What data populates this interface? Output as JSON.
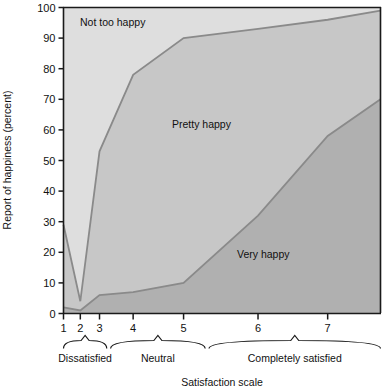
{
  "chart_data": {
    "type": "area",
    "title": "",
    "xlabel": "Satisfaction scale",
    "ylabel": "Report of happiness (percent)",
    "ylim": [
      0,
      100
    ],
    "xlim": [
      1,
      7.6
    ],
    "grid": false,
    "legend_position": "inline-labels",
    "y_ticks": [
      "0",
      "10",
      "20",
      "30",
      "40",
      "50",
      "60",
      "70",
      "80",
      "90",
      "100"
    ],
    "y_tick_values": [
      0,
      10,
      20,
      30,
      40,
      50,
      60,
      70,
      80,
      90,
      100
    ],
    "x_ticks": [
      "1",
      "2",
      "3",
      "4",
      "5",
      "6",
      "7"
    ],
    "x_tick_values": [
      1,
      2,
      3,
      4,
      5,
      6,
      7
    ],
    "x_tick_positions": [
      1.0,
      1.35,
      1.75,
      2.45,
      3.5,
      5.05,
      6.5
    ],
    "x": [
      1.0,
      1.35,
      1.75,
      2.45,
      3.5,
      5.05,
      6.5,
      7.6
    ],
    "series": [
      {
        "name": "Very happy",
        "label": "Very happy",
        "color": "#b0b0b0",
        "values": [
          2,
          1,
          6,
          7,
          10,
          32,
          58,
          70
        ]
      },
      {
        "name": "Pretty happy",
        "label": "Pretty happy",
        "color": "#c7c7c7",
        "cumulative_top": [
          29,
          4,
          53,
          78,
          90,
          93,
          96,
          99
        ]
      },
      {
        "name": "Not too happy",
        "label": "Not too happy",
        "color": "#dedede",
        "cumulative_top": [
          100,
          100,
          100,
          100,
          100,
          100,
          100,
          100
        ]
      }
    ],
    "annotations": [
      {
        "text": "Not too happy",
        "x": 2.0,
        "y": 96
      },
      {
        "text": "Pretty happy",
        "x": 3.9,
        "y": 58
      },
      {
        "text": "Very happy",
        "x": 5.9,
        "y": 23
      }
    ],
    "group_brackets": [
      {
        "label": "Dissatisfied",
        "from": 1.0,
        "to": 1.9
      },
      {
        "label": "Neutral",
        "from": 1.98,
        "to": 3.95
      },
      {
        "label": "Completely satisfied",
        "from": 4.03,
        "to": 7.6
      }
    ]
  },
  "axes": {
    "y_title": "Report of happiness (percent)",
    "x_title": "Satisfaction scale"
  },
  "colors": {
    "band_top": "#dedede",
    "band_middle": "#c7c7c7",
    "band_bottom": "#b0b0b0",
    "line": "#8a8a8a",
    "frame": "#1a1a1a",
    "text": "#111111",
    "background": "#ffffff"
  }
}
